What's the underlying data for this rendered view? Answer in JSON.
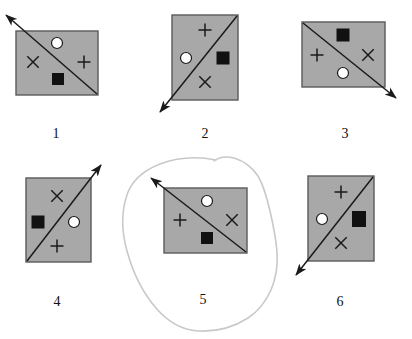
{
  "page": {
    "background_color": "#ffffff",
    "width": 412,
    "height": 339
  },
  "style": {
    "panel_fill": "#a8a8a8",
    "panel_stroke": "#5a5a5a",
    "diagonal_color": "#1a1a1a",
    "symbol_color": "#1a1a1a",
    "circle_fill": "#ffffff",
    "square_fill": "#111111",
    "annotation_color": "#c9c9c9",
    "label_color": "#111111"
  },
  "annotation": {
    "name": "hand-drawn-loop",
    "description": "hand drawn pale gray loop encircling figure 5",
    "color": "#c9c9c9",
    "stroke_width": 1.6,
    "path": "M 216 160 C 196 156 176 158 160 164 C 142 171 130 183 126 198 C 121 215 122 233 127 251 C 133 273 143 293 156 308 C 168 322 182 330 198 331 C 216 332 234 327 248 318 C 259 311 266 301 271 290 C 276 278 278 265 277 252 C 276 238 273 224 270 211 C 267 198 264 186 258 176 C 252 167 244 161 234 158 C 226 156 219 157 214 161"
  },
  "figures": [
    {
      "id": "figure-1",
      "label": "1",
      "label_x": 56,
      "label_y": 126,
      "panel": {
        "x": 16,
        "y": 31,
        "width": 82,
        "height": 64
      },
      "diagonal": {
        "from": "bottom-right",
        "to": "top-left"
      },
      "arrow": {
        "direction": "up-left",
        "tip_x": 6,
        "tip_y": 15,
        "tail_x": 97,
        "tail_y": 94
      },
      "symbols": [
        {
          "type": "circle",
          "name": "white-circle",
          "x": 57,
          "y": 43,
          "size": 11
        },
        {
          "type": "cross-x",
          "name": "x-mark",
          "x": 33,
          "y": 62,
          "size": 13
        },
        {
          "type": "plus",
          "name": "plus-mark",
          "x": 84,
          "y": 62,
          "size": 13
        },
        {
          "type": "square",
          "name": "black-square",
          "x": 58,
          "y": 79,
          "size": 12
        }
      ]
    },
    {
      "id": "figure-2",
      "label": "2",
      "label_x": 205,
      "label_y": 126,
      "panel": {
        "x": 172,
        "y": 15,
        "width": 66,
        "height": 85
      },
      "diagonal": {
        "from": "top-right",
        "to": "bottom-left"
      },
      "arrow": {
        "direction": "down-left",
        "tip_x": 160,
        "tip_y": 112,
        "tail_x": 237,
        "tail_y": 16
      },
      "symbols": [
        {
          "type": "plus",
          "name": "plus-mark",
          "x": 205,
          "y": 30,
          "size": 13
        },
        {
          "type": "circle",
          "name": "white-circle",
          "x": 186,
          "y": 58,
          "size": 11
        },
        {
          "type": "square",
          "name": "black-square",
          "x": 223,
          "y": 58,
          "size": 13
        },
        {
          "type": "cross-x",
          "name": "x-mark",
          "x": 205,
          "y": 82,
          "size": 13
        }
      ]
    },
    {
      "id": "figure-3",
      "label": "3",
      "label_x": 345,
      "label_y": 126,
      "panel": {
        "x": 302,
        "y": 22,
        "width": 83,
        "height": 65
      },
      "diagonal": {
        "from": "top-left",
        "to": "bottom-right"
      },
      "arrow": {
        "direction": "down-right",
        "tip_x": 396,
        "tip_y": 98,
        "tail_x": 303,
        "tail_y": 23
      },
      "symbols": [
        {
          "type": "square",
          "name": "black-square",
          "x": 343,
          "y": 35,
          "size": 13
        },
        {
          "type": "plus",
          "name": "plus-mark",
          "x": 317,
          "y": 55,
          "size": 13
        },
        {
          "type": "cross-x",
          "name": "x-mark",
          "x": 368,
          "y": 55,
          "size": 13
        },
        {
          "type": "circle",
          "name": "white-circle",
          "x": 343,
          "y": 73,
          "size": 11
        }
      ]
    },
    {
      "id": "figure-4",
      "label": "4",
      "label_x": 57,
      "label_y": 294,
      "panel": {
        "x": 26,
        "y": 178,
        "width": 65,
        "height": 84
      },
      "diagonal": {
        "from": "bottom-left",
        "to": "top-right"
      },
      "arrow": {
        "direction": "up-right",
        "tip_x": 101,
        "tip_y": 165,
        "tail_x": 27,
        "tail_y": 261
      },
      "symbols": [
        {
          "type": "cross-x",
          "name": "x-mark",
          "x": 57,
          "y": 196,
          "size": 13
        },
        {
          "type": "square",
          "name": "black-square",
          "x": 38,
          "y": 222,
          "size": 13
        },
        {
          "type": "circle",
          "name": "white-circle",
          "x": 74,
          "y": 222,
          "size": 11
        },
        {
          "type": "plus",
          "name": "plus-mark",
          "x": 57,
          "y": 246,
          "size": 13
        }
      ]
    },
    {
      "id": "figure-5",
      "label": "5",
      "label_x": 203,
      "label_y": 292,
      "panel": {
        "x": 164,
        "y": 188,
        "width": 83,
        "height": 65
      },
      "diagonal": {
        "from": "bottom-right",
        "to": "top-left"
      },
      "arrow": {
        "direction": "up-left",
        "tip_x": 151,
        "tip_y": 178,
        "tail_x": 246,
        "tail_y": 252
      },
      "symbols": [
        {
          "type": "circle",
          "name": "white-circle",
          "x": 207,
          "y": 201,
          "size": 11
        },
        {
          "type": "plus",
          "name": "plus-mark",
          "x": 180,
          "y": 220,
          "size": 13
        },
        {
          "type": "cross-x",
          "name": "x-mark",
          "x": 232,
          "y": 220,
          "size": 13
        },
        {
          "type": "square",
          "name": "black-square",
          "x": 207,
          "y": 238,
          "size": 12
        }
      ]
    },
    {
      "id": "figure-6",
      "label": "6",
      "label_x": 340,
      "label_y": 294,
      "panel": {
        "x": 308,
        "y": 176,
        "width": 66,
        "height": 85
      },
      "diagonal": {
        "from": "top-right",
        "to": "bottom-left"
      },
      "arrow": {
        "direction": "down-left",
        "tip_x": 296,
        "tip_y": 275,
        "tail_x": 373,
        "tail_y": 177
      },
      "symbols": [
        {
          "type": "plus",
          "name": "plus-mark",
          "x": 341,
          "y": 192,
          "size": 13
        },
        {
          "type": "circle",
          "name": "white-circle",
          "x": 322,
          "y": 219,
          "size": 11
        },
        {
          "type": "square",
          "name": "black-square",
          "x": 359,
          "y": 219,
          "size": 14
        },
        {
          "type": "cross-x",
          "name": "x-mark",
          "x": 341,
          "y": 243,
          "size": 13
        }
      ]
    }
  ]
}
